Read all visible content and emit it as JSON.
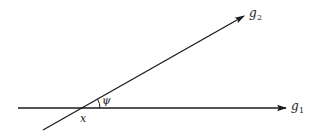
{
  "diagram": {
    "lines": [
      {
        "id": "g1",
        "label": "g",
        "subscript": "1",
        "from": [
          18,
          108
        ],
        "to": [
          286,
          108
        ]
      },
      {
        "id": "g2",
        "label": "g",
        "subscript": "2",
        "from": [
          43,
          130
        ],
        "to": [
          244,
          16
        ]
      }
    ],
    "intersection_label": "x",
    "angle_label": "ψ",
    "stroke_color": "#1a1a1a",
    "background": "#ffffff"
  }
}
